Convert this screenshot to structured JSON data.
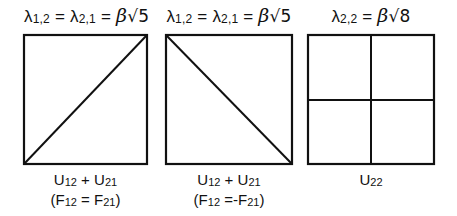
{
  "panels": [
    {
      "title": {
        "lhs_a": "λ",
        "sub_a": "1,2",
        "eq1": " = ",
        "lhs_b": "λ",
        "sub_b": "2,1",
        "eq2": " = ",
        "beta": "β",
        "sqrt": "√5"
      },
      "diagonal": "bottom-left-to-top-right",
      "caption_line1": {
        "a": "U",
        "sub_a": "12",
        "plus": " + ",
        "b": "U",
        "sub_b": "21"
      },
      "caption_line2": {
        "open": "(F",
        "sub_a": "12",
        "eq": " = F",
        "sub_b": "21",
        "close": ")"
      }
    },
    {
      "title": {
        "lhs_a": "λ",
        "sub_a": "1,2",
        "eq1": " = ",
        "lhs_b": "λ",
        "sub_b": "2,1",
        "eq2": " = ",
        "beta": "β",
        "sqrt": "√5"
      },
      "diagonal": "top-left-to-bottom-right",
      "caption_line1": {
        "a": "U",
        "sub_a": "12",
        "plus": " + ",
        "b": "U",
        "sub_b": "21"
      },
      "caption_line2": {
        "open": "(F",
        "sub_a": "12",
        "eq": " =-F",
        "sub_b": "21",
        "close": ")"
      }
    },
    {
      "title": {
        "lhs_a": "λ",
        "sub_a": "2,2",
        "eq1": " = ",
        "beta": "β",
        "sqrt": "√8"
      },
      "diagonal": "cross-quadrants",
      "caption_line1": {
        "a": "U",
        "sub_a": "22"
      }
    }
  ]
}
